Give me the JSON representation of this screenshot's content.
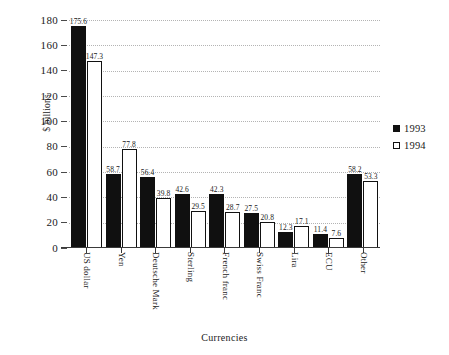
{
  "chart_data": {
    "type": "bar",
    "title": "",
    "xlabel": "Currencies",
    "ylabel": "$ billions",
    "ylim": [
      0,
      180
    ],
    "yticks": [
      0,
      20,
      40,
      60,
      80,
      100,
      120,
      140,
      160,
      180
    ],
    "grid": true,
    "legend_position": "right",
    "categories": [
      "US dollar",
      "Yen",
      "Deutsche Mark",
      "Sterling",
      "French franc",
      "Swiss Franc",
      "Lira",
      "ECU",
      "Other"
    ],
    "series": [
      {
        "name": "1993",
        "color": "#101010",
        "style": "filled",
        "values": [
          175.6,
          58.7,
          56.4,
          42.6,
          42.3,
          27.5,
          12.3,
          11.4,
          58.2
        ]
      },
      {
        "name": "1994",
        "color": "#ffffff",
        "style": "hollow",
        "values": [
          147.3,
          77.8,
          39.8,
          29.5,
          28.7,
          20.8,
          17.1,
          7.6,
          53.3
        ]
      }
    ],
    "data_labels": {
      "1993": [
        "175.6",
        "58.7",
        "56.4",
        "42.6",
        "42.3",
        "27.5",
        "12.3",
        "11.4",
        "58.2"
      ],
      "1994": [
        "147.3",
        "77.8",
        "39.8",
        "29.5",
        "28.7",
        "20.8",
        "17.1",
        "7.6",
        "53.3"
      ]
    }
  },
  "axes": {
    "y_title": "$ billions",
    "x_title": "Currencies",
    "y_tick_labels": [
      "0",
      "20",
      "40",
      "60",
      "80",
      "100",
      "120",
      "140",
      "160",
      "180"
    ]
  },
  "legend": {
    "entries": [
      {
        "label": "1993",
        "swatch": "filled-square-icon"
      },
      {
        "label": "1994",
        "swatch": "hollow-square-icon"
      }
    ]
  }
}
